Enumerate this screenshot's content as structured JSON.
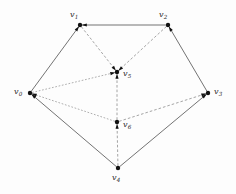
{
  "figure": {
    "width": 236,
    "height": 194,
    "background_color": "#fdfdfd"
  },
  "style": {
    "solid_edge_color": "#5a5a5a",
    "dashed_edge_color": "#8e8e8e",
    "dotted_edge_color": "#9a9a9a",
    "node_color": "#111111",
    "label_color": "#2b2b2b"
  },
  "nodes": [
    {
      "id": "v0",
      "base": "v",
      "sub": "0",
      "x": 30,
      "y": 93,
      "label_x": 14,
      "label_y": 88,
      "label": "v0"
    },
    {
      "id": "v1",
      "base": "v",
      "sub": "1",
      "x": 80,
      "y": 25,
      "label_x": 70,
      "label_y": 11,
      "label": "v1"
    },
    {
      "id": "v2",
      "base": "v",
      "sub": "2",
      "x": 168,
      "y": 25,
      "label_x": 159,
      "label_y": 11,
      "label": "v2"
    },
    {
      "id": "v3",
      "base": "v",
      "sub": "3",
      "x": 208,
      "y": 93,
      "label_x": 214,
      "label_y": 88,
      "label": "v3"
    },
    {
      "id": "v4",
      "base": "v",
      "sub": "4",
      "x": 118,
      "y": 168,
      "label_x": 112,
      "label_y": 174,
      "label": "v4"
    },
    {
      "id": "v5",
      "base": "v",
      "sub": "5",
      "x": 117,
      "y": 72,
      "label_x": 123,
      "label_y": 70,
      "label": "v5"
    },
    {
      "id": "v6",
      "base": "v",
      "sub": "6",
      "x": 117,
      "y": 122,
      "label_x": 123,
      "label_y": 121,
      "label": "v6"
    }
  ],
  "edges": [
    {
      "from": "v0",
      "to": "v1",
      "style": "solid",
      "arrow": true
    },
    {
      "from": "v2",
      "to": "v1",
      "style": "solid",
      "arrow": true
    },
    {
      "from": "v3",
      "to": "v2",
      "style": "solid",
      "arrow": true
    },
    {
      "from": "v4",
      "to": "v3",
      "style": "solid",
      "arrow": true
    },
    {
      "from": "v4",
      "to": "v0",
      "style": "solid",
      "arrow": true
    },
    {
      "from": "v1",
      "to": "v5",
      "style": "dashed",
      "arrow": true
    },
    {
      "from": "v2",
      "to": "v5",
      "style": "dashed",
      "arrow": true
    },
    {
      "from": "v0",
      "to": "v5",
      "style": "dotted",
      "arrow": true
    },
    {
      "from": "v6",
      "to": "v5",
      "style": "dashed",
      "arrow": true
    },
    {
      "from": "v4",
      "to": "v6",
      "style": "dashed",
      "arrow": true
    },
    {
      "from": "v6",
      "to": "v0",
      "style": "dotted",
      "arrow": true
    },
    {
      "from": "v6",
      "to": "v3",
      "style": "dashed",
      "arrow": true
    }
  ]
}
